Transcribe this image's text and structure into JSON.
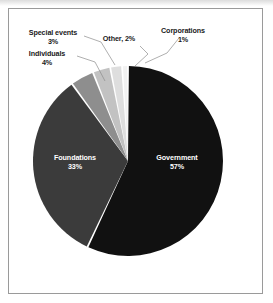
{
  "chart_data": {
    "type": "pie",
    "title": "",
    "categories": [
      "Government",
      "Foundations",
      "Individuals",
      "Special events",
      "Other",
      "Corporations"
    ],
    "values": [
      57,
      33,
      4,
      3,
      2,
      1
    ],
    "unit": "%",
    "legend_position": "none",
    "labels_inside": [
      "Government",
      "Foundations"
    ],
    "labels_outside": [
      "Individuals",
      "Special events",
      "Other",
      "Corporations"
    ],
    "start_angle_deg": 0,
    "direction": "clockwise",
    "colors": [
      "#111111",
      "#3b3b3b",
      "#8e8e8e",
      "#c2c2c2",
      "#dedede",
      "#f2f2f2"
    ],
    "slices": [
      {
        "name": "Government",
        "value": 57,
        "label": "Government",
        "pct_label": "57%",
        "color": "#111111",
        "text_color": "#ffffff",
        "placement": "inside"
      },
      {
        "name": "Foundations",
        "value": 33,
        "label": "Foundations",
        "pct_label": "33%",
        "color": "#3b3b3b",
        "text_color": "#ffffff",
        "placement": "inside"
      },
      {
        "name": "Individuals",
        "value": 4,
        "label": "Individuals",
        "pct_label": "4%",
        "color": "#8e8e8e",
        "text_color": "#1a1a1a",
        "placement": "outside"
      },
      {
        "name": "Special events",
        "value": 3,
        "label": "Special events",
        "pct_label": "3%",
        "color": "#c2c2c2",
        "text_color": "#1a1a1a",
        "placement": "outside"
      },
      {
        "name": "Other",
        "value": 2,
        "label": "Other, 2%",
        "pct_label": "2%",
        "color": "#dedede",
        "text_color": "#1a1a1a",
        "placement": "outside"
      },
      {
        "name": "Corporations",
        "value": 1,
        "label": "Corporations",
        "pct_label": "1%",
        "color": "#f2f2f2",
        "text_color": "#1a1a1a",
        "placement": "outside"
      }
    ]
  },
  "frame": {
    "border_color": "#9a9a9a",
    "background": "#ffffff"
  }
}
